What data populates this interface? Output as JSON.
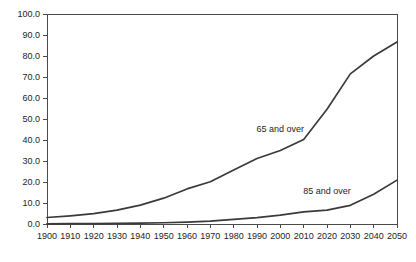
{
  "chart_data": {
    "type": "line",
    "title": "",
    "subtitle": "",
    "xlabel": "",
    "ylabel": "",
    "grid": false,
    "legend_position": "inline-annotation",
    "x": [
      1900,
      1910,
      1920,
      1930,
      1940,
      1950,
      1960,
      1970,
      1980,
      1990,
      2000,
      2010,
      2020,
      2030,
      2040,
      2050
    ],
    "xlim": [
      1900,
      2050
    ],
    "ylim": [
      0.0,
      100.0
    ],
    "xticks": [
      "1900",
      "1910",
      "1920",
      "1930",
      "1940",
      "1950",
      "1960",
      "1970",
      "1980",
      "1990",
      "2000",
      "2010",
      "2020",
      "2030",
      "2040",
      "2050"
    ],
    "yticks": [
      "0.0",
      "10.0",
      "20.0",
      "30.0",
      "40.0",
      "50.0",
      "60.0",
      "70.0",
      "80.0",
      "90.0",
      "100.0"
    ],
    "series": [
      {
        "name": "65 and over",
        "label": "65 and over",
        "color": "#3a3a3a",
        "values": [
          3.1,
          3.9,
          4.9,
          6.6,
          9.0,
          12.3,
          16.7,
          20.1,
          25.7,
          31.2,
          35.0,
          40.2,
          54.6,
          71.5,
          80.0,
          86.7
        ]
      },
      {
        "name": "85 and over",
        "label": "85 and over",
        "color": "#3a3a3a",
        "values": [
          0.1,
          0.2,
          0.2,
          0.3,
          0.4,
          0.6,
          0.9,
          1.4,
          2.2,
          3.0,
          4.2,
          5.8,
          6.6,
          8.9,
          14.2,
          20.9
        ]
      }
    ],
    "annotations": [
      {
        "text": "65 and over",
        "x": 2000,
        "y": 44.0
      },
      {
        "text": "85 and over",
        "x": 2020,
        "y": 14.5
      }
    ]
  }
}
